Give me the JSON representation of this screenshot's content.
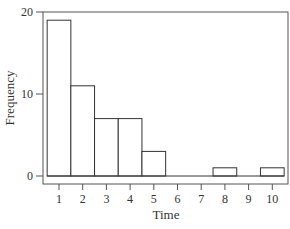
{
  "chart_data": {
    "type": "bar",
    "title": "",
    "xlabel": "Time",
    "ylabel": "Frequency",
    "categories": [
      "1",
      "2",
      "3",
      "4",
      "5",
      "6",
      "7",
      "8",
      "9",
      "10"
    ],
    "values": [
      19,
      11,
      7,
      7,
      3,
      0,
      0,
      1,
      0,
      1
    ],
    "yticks": [
      0,
      10,
      20
    ],
    "ylim": [
      -1,
      20
    ],
    "xlim": [
      0.4,
      10.7
    ],
    "grid": false,
    "legend": null,
    "colors": {
      "bar_fill": "#ffffff",
      "bar_stroke": "#333333",
      "axis": "#555555"
    }
  }
}
